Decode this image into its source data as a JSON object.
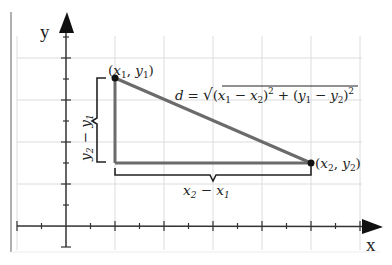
{
  "diagram": {
    "axes": {
      "x_label": "x",
      "y_label": "y"
    },
    "points": [
      {
        "id": "p1",
        "label_prefix": "(",
        "label_var1": "x",
        "label_sub1": "1",
        "label_sep": ", ",
        "label_var2": "y",
        "label_sub2": "1",
        "label_suffix": ")"
      },
      {
        "id": "p2",
        "label_prefix": "(",
        "label_var1": "x",
        "label_sub1": "2",
        "label_sep": ", ",
        "label_var2": "y",
        "label_sub2": "2",
        "label_suffix": ")"
      }
    ],
    "formula": {
      "lhs": "d",
      "eq": " = ",
      "radical": "√",
      "t1_open": "(",
      "t1_a": "x",
      "t1_a_sub": "1",
      "t1_minus": " − ",
      "t1_b": "x",
      "t1_b_sub": "2",
      "t1_close": ")",
      "t1_exp": "2",
      "plus": " + ",
      "t2_open": "(",
      "t2_a": "y",
      "t2_a_sub": "1",
      "t2_minus": " − ",
      "t2_b": "y",
      "t2_b_sub": "2",
      "t2_close": ")",
      "t2_exp": "2"
    },
    "horizontal_brace": {
      "a": "x",
      "a_sub": "2",
      "minus": " − ",
      "b": "x",
      "b_sub": "1"
    },
    "vertical_brace": {
      "a": "y",
      "a_sub": "2",
      "minus": " − ",
      "b": "y",
      "b_sub": "1"
    },
    "colors": {
      "triangle": "#6b6b6b",
      "axis": "#333333",
      "grid": "#dcdcdc",
      "frame": "#b0b0b0",
      "brace": "#222222",
      "point": "#111111"
    }
  }
}
